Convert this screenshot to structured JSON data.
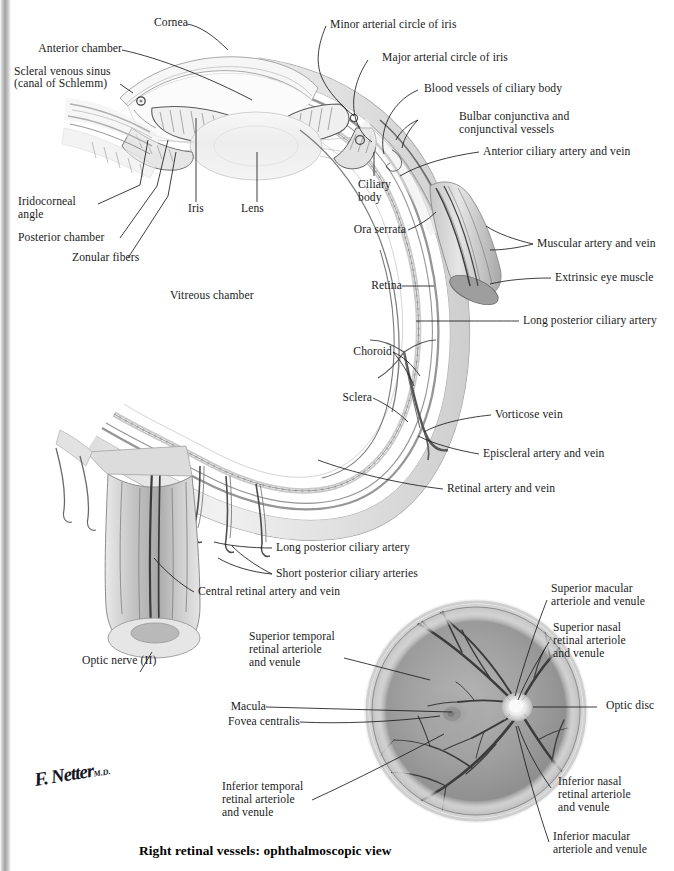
{
  "plate": {
    "title": "Right retinal vessels: ophthalmoscopic view",
    "signature": "F. Netter",
    "signature_suffix": "M.D."
  },
  "colors": {
    "ink": "#1b1b1b",
    "fundus_base": "#9a9a9a",
    "fundus_rim": "#cfcfcf",
    "vessel": "#3a3a3a",
    "sclera_gray": "#b9b9b9",
    "tissue_light": "#ededed",
    "background": "#ffffff"
  },
  "labels": {
    "cornea": "Cornea",
    "anterior_chamber": "Anterior chamber",
    "scleral_venous_sinus_l1": "Scleral venous sinus",
    "scleral_venous_sinus_l2": "(canal of Schlemm)",
    "iridocorneal_angle_l1": "Iridocorneal",
    "iridocorneal_angle_l2": "angle",
    "posterior_chamber": "Posterior chamber",
    "zonular_fibers": "Zonular fibers",
    "iris": "Iris",
    "lens": "Lens",
    "vitreous_chamber": "Vitreous chamber",
    "minor_arterial_circle": "Minor arterial circle of iris",
    "major_arterial_circle": "Major arterial circle of iris",
    "blood_vessels_ciliary_body": "Blood vessels of ciliary body",
    "bulbar_conjunctiva_l1": "Bulbar conjunctiva and",
    "bulbar_conjunctiva_l2": "conjunctival vessels",
    "anterior_ciliary": "Anterior ciliary artery and vein",
    "ciliary_body_l1": "Ciliary",
    "ciliary_body_l2": "body",
    "ora_serrata": "Ora serrata",
    "retina": "Retina",
    "choroid": "Choroid",
    "sclera": "Sclera",
    "muscular_artery_vein": "Muscular artery and vein",
    "extrinsic_eye_muscle": "Extrinsic eye muscle",
    "long_posterior_ciliary_artery_top": "Long posterior ciliary artery",
    "vorticose_vein": "Vorticose vein",
    "episcleral_artery_vein": "Episcleral artery and vein",
    "retinal_artery_vein": "Retinal artery and vein",
    "long_posterior_ciliary_artery_bottom": "Long posterior ciliary artery",
    "short_posterior_ciliary_arteries": "Short posterior ciliary arteries",
    "central_retinal_artery_vein": "Central retinal artery and vein",
    "optic_nerve": "Optic nerve (II)",
    "superior_temporal_l1": "Superior temporal",
    "superior_temporal_l2": "retinal arteriole",
    "superior_temporal_l3": "and venule",
    "macula": "Macula",
    "fovea_centralis": "Fovea centralis",
    "inferior_temporal_l1": "Inferior temporal",
    "inferior_temporal_l2": "retinal arteriole",
    "inferior_temporal_l3": "and venule",
    "superior_macular_l1": "Superior macular",
    "superior_macular_l2": "arteriole and venule",
    "superior_nasal_l1": "Superior nasal",
    "superior_nasal_l2": "retinal arteriole",
    "superior_nasal_l3": "and venule",
    "optic_disc": "Optic disc",
    "inferior_nasal_l1": "Inferior nasal",
    "inferior_nasal_l2": "retinal arteriole",
    "inferior_nasal_l3": "and venule",
    "inferior_macular_l1": "Inferior macular",
    "inferior_macular_l2": "arteriole and venule"
  }
}
